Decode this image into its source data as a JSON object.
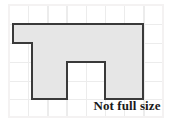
{
  "figure": {
    "caption": "Not full size",
    "kind": "grid-paper-polygon",
    "background_color": "#ffffff",
    "grid": {
      "line_color": "#eceaea",
      "border_color": "#f2f0f0",
      "cell_width": 19.2,
      "cell_height": 19.0,
      "origin_x": 9,
      "origin_y": 5,
      "columns": 8,
      "rows": 6
    },
    "shape": {
      "name": "arch-shape",
      "fill_color": "#e6e6e6",
      "stroke_color": "#3a3a3a",
      "stroke_width": 2,
      "points": "32,24 143,24 143,99 105,99 105,62 67,62 67,99 32,99 32,43 13,43 13,24",
      "vertices": [
        [
          32,
          24
        ],
        [
          143,
          24
        ],
        [
          143,
          99
        ],
        [
          105,
          99
        ],
        [
          105,
          62
        ],
        [
          67,
          62
        ],
        [
          67,
          99
        ],
        [
          32,
          99
        ],
        [
          32,
          43
        ],
        [
          13,
          43
        ],
        [
          13,
          24
        ]
      ]
    }
  }
}
